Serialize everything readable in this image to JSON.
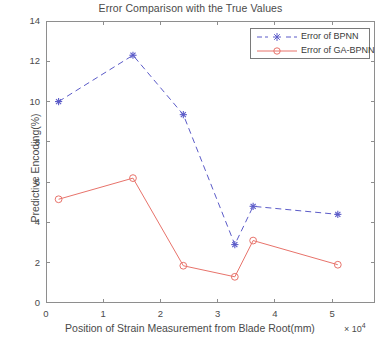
{
  "chart_data": {
    "type": "line",
    "title": "Error Comparison with the True Values",
    "xlabel": "Position of Strain Measurement from Blade Root(mm)",
    "x_exponent_label": "× 10",
    "x_exponent_power": "4",
    "ylabel": "Predictive Encoding(%)",
    "xlim": [
      0,
      5.75
    ],
    "ylim": [
      0,
      14
    ],
    "xticks": [
      0,
      1,
      2,
      3,
      4,
      5
    ],
    "xtick_labels": [
      "0",
      "1",
      "2",
      "3",
      "4",
      "5"
    ],
    "yticks": [
      0,
      2,
      4,
      6,
      8,
      10,
      12,
      14
    ],
    "ytick_labels": [
      "0",
      "2",
      "4",
      "6",
      "8",
      "10",
      "12",
      "14"
    ],
    "grid": false,
    "legend_position": "top-right",
    "series": [
      {
        "name": "Error of BPNN",
        "color": "#5b5bc8",
        "linestyle": "dashed",
        "marker": "star",
        "x": [
          0.22,
          1.52,
          2.4,
          3.3,
          3.62,
          5.1
        ],
        "values": [
          10.0,
          12.3,
          9.35,
          2.9,
          4.8,
          4.4
        ]
      },
      {
        "name": "Error of GA-BPNN",
        "color": "#e8736b",
        "linestyle": "solid",
        "marker": "circle",
        "x": [
          0.22,
          1.52,
          2.4,
          3.3,
          3.62,
          5.1
        ],
        "values": [
          5.15,
          6.2,
          1.85,
          1.3,
          3.1,
          1.9
        ]
      }
    ]
  },
  "legend": {
    "entries": [
      {
        "label": "Error of BPNN"
      },
      {
        "label": "Error of GA-BPNN"
      }
    ]
  },
  "colors": {
    "bpnn": "#5b5bc8",
    "ga_bpnn": "#e8736b",
    "axis": "#8e8e8e",
    "text": "#4a4a4a",
    "background": "#ffffff"
  }
}
